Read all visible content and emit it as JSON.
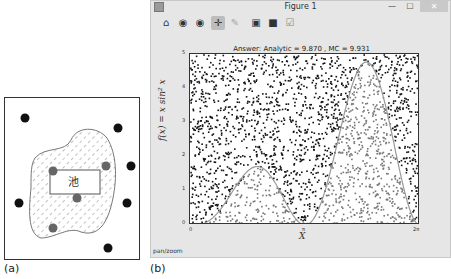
{
  "panel_a": {
    "label": "(a)",
    "pond_label": "池",
    "outside_points": [
      [
        20,
        20
      ],
      [
        113,
        30
      ],
      [
        126,
        68
      ],
      [
        14,
        105
      ],
      [
        122,
        105
      ],
      [
        103,
        150
      ]
    ],
    "inside_points": [
      [
        48,
        73
      ],
      [
        101,
        68
      ],
      [
        72,
        100
      ],
      [
        48,
        130
      ]
    ]
  },
  "panel_b": {
    "label": "(b)",
    "window": {
      "title": "Figure 1",
      "controls": {
        "minimize": "—",
        "maximize": "☐",
        "close": "✕"
      }
    },
    "toolbar": [
      {
        "name": "home-icon",
        "glyph": "⌂"
      },
      {
        "name": "back-icon",
        "glyph": "◉"
      },
      {
        "name": "forward-icon",
        "glyph": "◉"
      },
      {
        "name": "pan-icon",
        "glyph": "✛",
        "active": true
      },
      {
        "name": "zoom-icon",
        "glyph": "✎"
      },
      {
        "name": "configure-subplots-icon",
        "glyph": "▣"
      },
      {
        "name": "save-icon",
        "glyph": "■"
      },
      {
        "name": "edit-icon",
        "glyph": "☑"
      }
    ],
    "status": "pan/zoom"
  },
  "chart_data": {
    "type": "scatter",
    "title": "Answer: Analytic = 9.870 , MC = 9.931",
    "xlabel": "X",
    "ylabel": "f(x) = x sin² x",
    "xlim": [
      0,
      6.2832
    ],
    "ylim": [
      0,
      5
    ],
    "xticks": [
      "0",
      "π",
      "2π"
    ],
    "yticks": [
      "0",
      "1",
      "2",
      "3",
      "4",
      "5"
    ],
    "grid": false,
    "legend": null,
    "series": [
      {
        "name": "curve f(x)=x sin²x",
        "type": "line",
        "color": "#999999"
      },
      {
        "name": "points above curve",
        "color": "#111111"
      },
      {
        "name": "points below curve",
        "color": "#777777"
      }
    ],
    "analytic": 9.87,
    "mc": 9.931
  }
}
